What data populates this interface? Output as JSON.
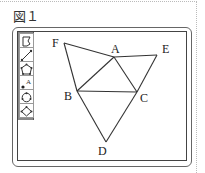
{
  "figure": {
    "title": "図１"
  },
  "toolbar": {
    "tools": [
      {
        "name": "select-tool",
        "icon": "pointer-icon"
      },
      {
        "name": "segment-tool",
        "icon": "line-icon"
      },
      {
        "name": "polygon-tool",
        "icon": "polygon-icon"
      },
      {
        "name": "point-label-tool",
        "icon": "point-label-icon",
        "glyph": "A"
      },
      {
        "name": "circle-tool",
        "icon": "circle-icon"
      },
      {
        "name": "rhombus-tool",
        "icon": "rhombus-icon"
      }
    ]
  },
  "diagram": {
    "points": {
      "F": {
        "label": "F"
      },
      "A": {
        "label": "A"
      },
      "E": {
        "label": "E"
      },
      "B": {
        "label": "B"
      },
      "C": {
        "label": "C"
      },
      "D": {
        "label": "D"
      }
    }
  }
}
